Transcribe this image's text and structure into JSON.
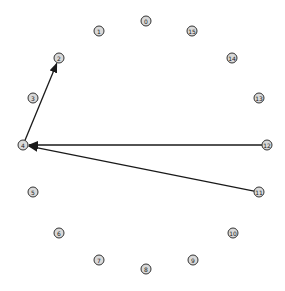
{
  "diagram": {
    "type": "directed-graph-circular-layout",
    "node_color": "#d9d9d9",
    "node_stroke": "#333333",
    "edge_color": "#1a1a1a",
    "nodes": [
      {
        "id": "0",
        "label": "0",
        "x": 146,
        "y": 21
      },
      {
        "id": "1",
        "label": "1",
        "x": 99,
        "y": 31
      },
      {
        "id": "2",
        "label": "2",
        "x": 59,
        "y": 58
      },
      {
        "id": "3",
        "label": "3",
        "x": 33,
        "y": 98
      },
      {
        "id": "4",
        "label": "4",
        "x": 23,
        "y": 145
      },
      {
        "id": "5",
        "label": "5",
        "x": 33,
        "y": 192
      },
      {
        "id": "6",
        "label": "6",
        "x": 59,
        "y": 233
      },
      {
        "id": "7",
        "label": "7",
        "x": 99,
        "y": 260
      },
      {
        "id": "8",
        "label": "8",
        "x": 146,
        "y": 269
      },
      {
        "id": "9",
        "label": "9",
        "x": 193,
        "y": 260
      },
      {
        "id": "10",
        "label": "10",
        "x": 233,
        "y": 233
      },
      {
        "id": "11",
        "label": "11",
        "x": 259,
        "y": 192
      },
      {
        "id": "12",
        "label": "12",
        "x": 267,
        "y": 145
      },
      {
        "id": "13",
        "label": "13",
        "x": 259,
        "y": 98
      },
      {
        "id": "14",
        "label": "14",
        "x": 232,
        "y": 58
      },
      {
        "id": "15",
        "label": "15",
        "x": 192,
        "y": 31
      }
    ],
    "edges": [
      {
        "from": "4",
        "to": "2"
      },
      {
        "from": "12",
        "to": "4"
      },
      {
        "from": "11",
        "to": "4"
      }
    ]
  }
}
